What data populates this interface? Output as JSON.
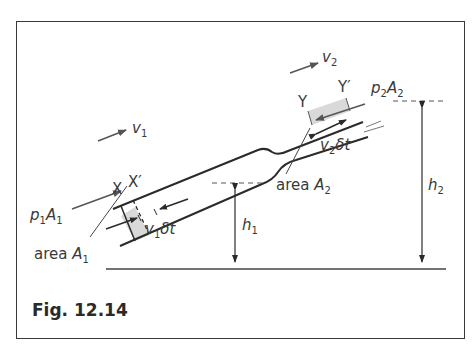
{
  "figure": {
    "caption": "Fig. 12.14",
    "labels": {
      "v1": {
        "sym": "v",
        "sub": "1"
      },
      "v2": {
        "sym": "v",
        "sub": "2"
      },
      "X": "X",
      "Xprime": "X′",
      "Y": "Y",
      "Yprime": "Y′",
      "p1A1": {
        "p": "p",
        "psub": "1",
        "A": "A",
        "Asub": "1"
      },
      "p2A2": {
        "p": "p",
        "psub": "2",
        "A": "A",
        "Asub": "2"
      },
      "v1dt": {
        "sym": "v",
        "sub": "1",
        "rest": "δt"
      },
      "v2dt": {
        "sym": "v",
        "sub": "2",
        "rest": "δt"
      },
      "areaA1": {
        "word": "area ",
        "A": "A",
        "sub": "1"
      },
      "areaA2": {
        "word": "area ",
        "A": "A",
        "sub": "2"
      },
      "h1": {
        "sym": "h",
        "sub": "1"
      },
      "h2": {
        "sym": "h",
        "sub": "2"
      }
    },
    "colors": {
      "line": "#2a2a2a",
      "shade": "#d9d9d9",
      "frame": "#3a3a3a"
    }
  }
}
